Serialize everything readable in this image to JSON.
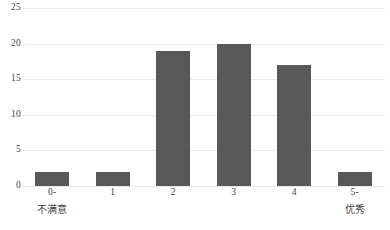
{
  "chart_data": {
    "type": "bar",
    "title": "",
    "subtitle": "",
    "xlabel": "",
    "ylabel": "",
    "categories": [
      "0-",
      "1",
      "2",
      "3",
      "4",
      "5-"
    ],
    "category_sublabels": [
      "不满意",
      "",
      "",
      "",
      "",
      "优秀"
    ],
    "values": [
      2,
      2,
      19,
      20,
      17,
      2
    ],
    "ylim": [
      0,
      25
    ],
    "yticks": [
      0,
      5,
      10,
      15,
      20,
      25
    ],
    "ytick_labels": [
      "0",
      "5",
      "10",
      "15",
      "20",
      "25"
    ],
    "grid": true,
    "grid_axis": "y",
    "legend": false,
    "legend_position": "none",
    "colors": {
      "bar": "#595959",
      "gridline": "#e9e9e9",
      "text": "#3f3f3f",
      "background": "#ffffff"
    }
  }
}
